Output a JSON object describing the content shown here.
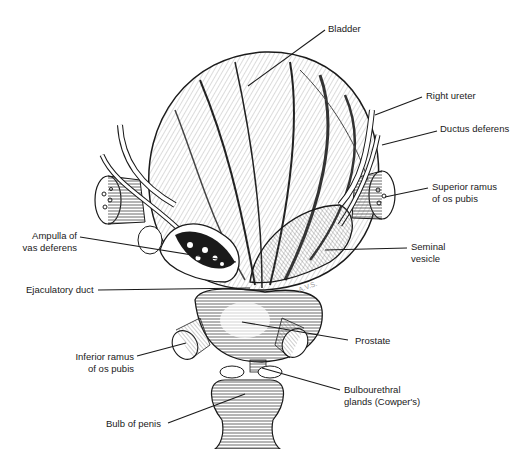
{
  "figure": {
    "artist_initials": "A.V.S.",
    "labels": {
      "bladder": "Bladder",
      "right_ureter": "Right ureter",
      "ductus_deferens": "Ductus deferens",
      "superior_ramus": "Superior ramus\nof os pubis",
      "seminal_vesicle": "Seminal\nvesicle",
      "ampulla": "Ampulla of\nvas deferens",
      "ejaculatory_duct": "Ejaculatory duct",
      "prostate": "Prostate",
      "inferior_ramus": "Inferior ramus\nof os pubis",
      "bulbourethral": "Bulbourethral\nglands (Cowper's)",
      "bulb_of_penis": "Bulb of penis"
    },
    "colors": {
      "ink": "#1a1a1a",
      "paper": "#ffffff",
      "shade": "#555555"
    }
  }
}
